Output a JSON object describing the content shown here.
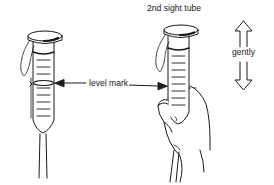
{
  "diagram": {
    "title": "2nd sight tube",
    "labels": {
      "level_mark": "level mark",
      "motion": "gently"
    },
    "figures": [
      {
        "id": "sight-tube-1",
        "description": "sight tube hanging with cap and chain"
      },
      {
        "id": "sight-tube-2",
        "description": "second sight tube held in hand"
      }
    ],
    "motion_arrow": "double-headed vertical arrow",
    "colors": {
      "stroke": "#1a1a1a",
      "background": "#ffffff"
    }
  }
}
